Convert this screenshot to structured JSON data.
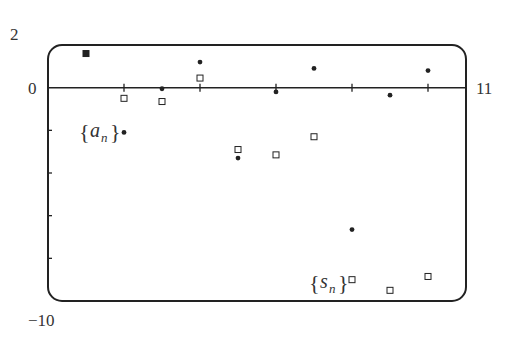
{
  "chart_data": {
    "type": "scatter",
    "title": "",
    "xlabel": "",
    "ylabel": "",
    "xlim": [
      0,
      11
    ],
    "ylim": [
      -10,
      2
    ],
    "grid": false,
    "axis_labels": {
      "y_top": "2",
      "y_zero": "0",
      "y_bottom": "−10",
      "x_right": "11"
    },
    "x_ticks": [
      2,
      4,
      6,
      8,
      10
    ],
    "y_ticks": [
      0,
      -2,
      -4,
      -6,
      -8
    ],
    "x": [
      1,
      2,
      3,
      4,
      5,
      6,
      7,
      8,
      9,
      10
    ],
    "series": [
      {
        "name": "a_n",
        "label_text": "a",
        "label_sub": "n",
        "marker": "filled-dot",
        "values": [
          1.6,
          -2.1,
          -0.05,
          1.2,
          -3.3,
          -0.2,
          0.9,
          -6.65,
          -0.35,
          0.8
        ]
      },
      {
        "name": "s_n",
        "label_text": "s",
        "label_sub": "n",
        "marker": "open-square",
        "values": [
          1.6,
          -0.5,
          -0.65,
          0.45,
          -2.9,
          -3.15,
          -2.3,
          -9.0,
          -9.5,
          -8.85
        ]
      }
    ],
    "legend_position": "inline annotations: {a_n} near n=2, {s_n} near n=8"
  },
  "colors": {
    "ink": "#222222",
    "background": "#ffffff"
  }
}
